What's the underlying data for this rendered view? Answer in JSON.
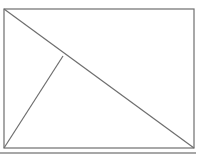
{
  "image": {
    "width": 205,
    "height": 165,
    "background_color": "#ffffff",
    "description": "Line drawing of a rectangle with two internal diagonal lines forming triangles"
  },
  "figure": {
    "name": "rectangle-with-diagonals",
    "stroke_color": "#6e6e6e",
    "stroke_width": 1.2,
    "fill": "none",
    "rectangle": {
      "left": 4,
      "top": 9,
      "right": 194,
      "bottom": 148,
      "width": 190,
      "height": 139
    },
    "points": {
      "top_left": [
        4,
        9
      ],
      "top_right": [
        194,
        9
      ],
      "bottom_right": [
        194,
        148
      ],
      "bottom_left": [
        4,
        148
      ],
      "junction": [
        63,
        56
      ]
    },
    "lines": [
      {
        "name": "main-diagonal",
        "from": [
          4,
          9
        ],
        "to": [
          194,
          148
        ]
      },
      {
        "name": "secondary-diagonal",
        "from": [
          63,
          56
        ],
        "to": [
          4,
          148
        ]
      }
    ]
  },
  "border": {
    "bottom_shadow_color": "#8a8a8a",
    "bottom_shadow_y": 152,
    "bottom_shadow_width": 196,
    "bottom_shadow_height": 2
  }
}
